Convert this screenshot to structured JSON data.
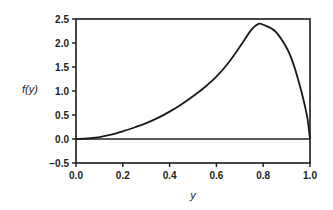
{
  "chart_data": {
    "type": "line",
    "title": "",
    "xlabel": "y",
    "ylabel": "f(y)",
    "xlim": [
      0.0,
      1.0
    ],
    "ylim": [
      -0.5,
      2.5
    ],
    "xticks": [
      "0.0",
      "0.2",
      "0.4",
      "0.6",
      "0.8",
      "1.0"
    ],
    "yticks": [
      "-0.5",
      "0.0",
      "0.5",
      "1.0",
      "1.5",
      "2.0",
      "2.5"
    ],
    "grid": false,
    "legend": null,
    "baseline": 0.0,
    "series": [
      {
        "name": "f(y)",
        "x": [
          0.0,
          0.05,
          0.1,
          0.15,
          0.2,
          0.25,
          0.3,
          0.35,
          0.4,
          0.45,
          0.5,
          0.55,
          0.6,
          0.65,
          0.7,
          0.75,
          0.78,
          0.8,
          0.85,
          0.9,
          0.93,
          0.96,
          0.98,
          0.99,
          1.0
        ],
        "values": [
          0.0,
          0.01,
          0.04,
          0.09,
          0.16,
          0.24,
          0.33,
          0.44,
          0.57,
          0.72,
          0.89,
          1.08,
          1.3,
          1.58,
          1.92,
          2.28,
          2.4,
          2.38,
          2.25,
          1.9,
          1.55,
          1.05,
          0.65,
          0.4,
          0.0
        ]
      }
    ]
  }
}
